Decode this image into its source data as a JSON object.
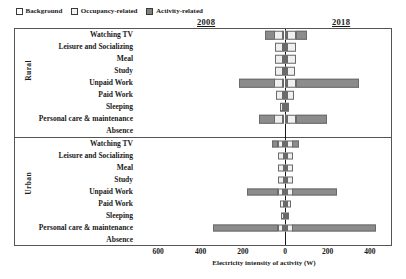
{
  "legend": {
    "items": [
      {
        "label": "Background",
        "key": "background",
        "color": "#ffffff"
      },
      {
        "label": "Occupancy-related",
        "key": "occupancy",
        "color": "#f0f0f0"
      },
      {
        "label": "Activity-related",
        "key": "activity",
        "color": "#8c8c8c"
      }
    ],
    "position": "top-left"
  },
  "years": {
    "left_year": "2008",
    "right_year": "2018"
  },
  "groups": {
    "rural_label": "Rural",
    "urban_label": "Urban"
  },
  "chart_data": {
    "type": "bar",
    "orientation": "horizontal",
    "layout": "diverging-stacked-butterfly",
    "title": "",
    "subtitle": "",
    "xlabel": "Electricity intensity of activity (W)",
    "ylabel": "",
    "xlim": [
      -700,
      500
    ],
    "xticks": [
      -600,
      -400,
      -200,
      0,
      200,
      400
    ],
    "xtick_labels": [
      "600",
      "400",
      "200",
      "0",
      "200",
      "400"
    ],
    "grid": false,
    "legend_entries": [
      "Background",
      "Occupancy-related",
      "Activity-related"
    ],
    "annotations": [
      {
        "text": "2008",
        "side": "left",
        "note": "left half of diverging axis"
      },
      {
        "text": "2018",
        "side": "right",
        "note": "right half of diverging axis"
      }
    ],
    "categories": [
      "Watching TV",
      "Leisure and Socializing",
      "Meal",
      "Study",
      "Unpaid Work",
      "Paid Work",
      "Sleeping",
      "Personal care & maintenance",
      "Absence"
    ],
    "panels": [
      {
        "name": "Rural",
        "rows": [
          {
            "category": "Watching TV",
            "left": {
              "background": 8,
              "occupancy": 40,
              "activity": 48
            },
            "right": {
              "background": 6,
              "occupancy": 46,
              "activity": 52
            }
          },
          {
            "category": "Leisure and Socializing",
            "left": {
              "background": 8,
              "occupancy": 40,
              "activity": 0
            },
            "right": {
              "background": 6,
              "occupancy": 46,
              "activity": 0
            }
          },
          {
            "category": "Meal",
            "left": {
              "background": 8,
              "occupancy": 40,
              "activity": 0
            },
            "right": {
              "background": 6,
              "occupancy": 46,
              "activity": 0
            }
          },
          {
            "category": "Study",
            "left": {
              "background": 8,
              "occupancy": 40,
              "activity": 0
            },
            "right": {
              "background": 6,
              "occupancy": 40,
              "activity": 0
            }
          },
          {
            "category": "Unpaid Work",
            "left": {
              "background": 8,
              "occupancy": 40,
              "activity": 168
            },
            "right": {
              "background": 6,
              "occupancy": 46,
              "activity": 300
            }
          },
          {
            "category": "Paid Work",
            "left": {
              "background": 8,
              "occupancy": 34,
              "activity": 0
            },
            "right": {
              "background": 6,
              "occupancy": 34,
              "activity": 0
            }
          },
          {
            "category": "Sleeping",
            "left": {
              "background": 8,
              "occupancy": 18,
              "activity": 0
            },
            "right": {
              "background": 6,
              "occupancy": 14,
              "activity": 0
            }
          },
          {
            "category": "Personal care & maintenance",
            "left": {
              "background": 8,
              "occupancy": 40,
              "activity": 74
            },
            "right": {
              "background": 6,
              "occupancy": 46,
              "activity": 150
            }
          },
          {
            "category": "Absence",
            "left": {
              "background": 0,
              "occupancy": 0,
              "activity": 0
            },
            "right": {
              "background": 0,
              "occupancy": 0,
              "activity": 0
            }
          }
        ]
      },
      {
        "name": "Urban",
        "rows": [
          {
            "category": "Watching TV",
            "left": {
              "background": 6,
              "occupancy": 26,
              "activity": 30
            },
            "right": {
              "background": 5,
              "occupancy": 30,
              "activity": 32
            }
          },
          {
            "category": "Leisure and Socializing",
            "left": {
              "background": 6,
              "occupancy": 26,
              "activity": 0
            },
            "right": {
              "background": 5,
              "occupancy": 30,
              "activity": 0
            }
          },
          {
            "category": "Meal",
            "left": {
              "background": 6,
              "occupancy": 26,
              "activity": 0
            },
            "right": {
              "background": 5,
              "occupancy": 30,
              "activity": 0
            }
          },
          {
            "category": "Study",
            "left": {
              "background": 6,
              "occupancy": 26,
              "activity": 0
            },
            "right": {
              "background": 5,
              "occupancy": 30,
              "activity": 0
            }
          },
          {
            "category": "Unpaid Work",
            "left": {
              "background": 6,
              "occupancy": 26,
              "activity": 150
            },
            "right": {
              "background": 5,
              "occupancy": 30,
              "activity": 210
            }
          },
          {
            "category": "Paid Work",
            "left": {
              "background": 6,
              "occupancy": 20,
              "activity": 0
            },
            "right": {
              "background": 5,
              "occupancy": 24,
              "activity": 0
            }
          },
          {
            "category": "Sleeping",
            "left": {
              "background": 6,
              "occupancy": 14,
              "activity": 0
            },
            "right": {
              "background": 5,
              "occupancy": 12,
              "activity": 0
            }
          },
          {
            "category": "Personal care & maintenance",
            "left": {
              "background": 6,
              "occupancy": 26,
              "activity": 310
            },
            "right": {
              "background": 5,
              "occupancy": 30,
              "activity": 395
            }
          },
          {
            "category": "Absence",
            "left": {
              "background": 0,
              "occupancy": 0,
              "activity": 0
            },
            "right": {
              "background": 0,
              "occupancy": 0,
              "activity": 0
            }
          }
        ]
      }
    ]
  }
}
